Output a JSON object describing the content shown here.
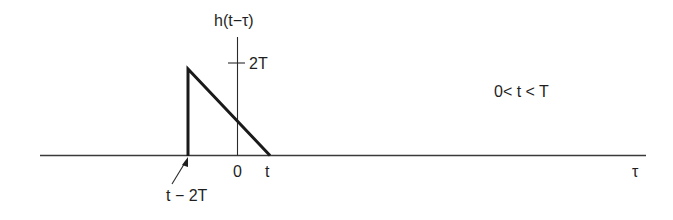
{
  "diagram": {
    "type": "signal-plot",
    "y_axis_label": "h(t−τ)",
    "x_axis_label": "τ",
    "y_tick_label": "2T",
    "x_ticks": {
      "origin": "0",
      "t": "t",
      "start": "t − 2T"
    },
    "condition": "0< t < T",
    "colors": {
      "line": "#1a1a1a",
      "axis": "#3a3a3a",
      "background": "#ffffff"
    }
  }
}
